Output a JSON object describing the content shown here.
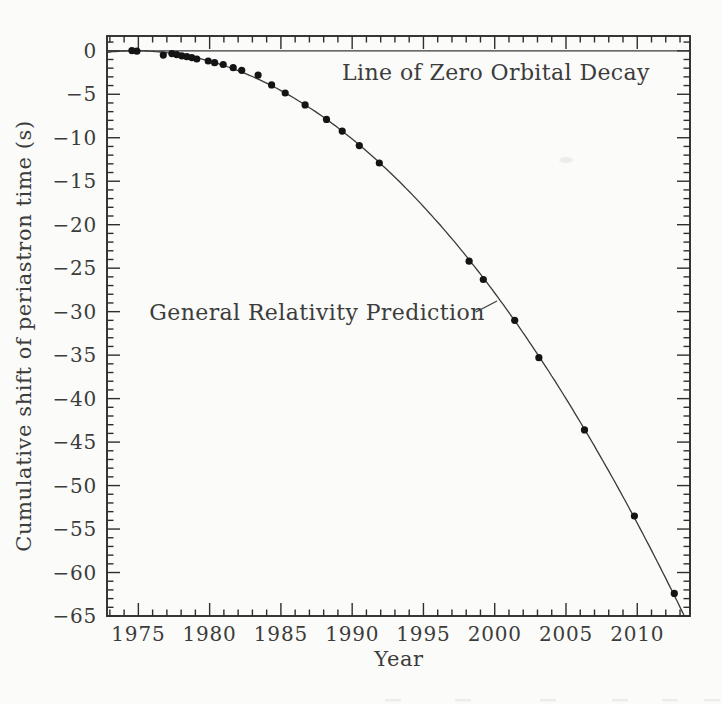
{
  "page": {
    "background": "#fbfbf9"
  },
  "chart_data": {
    "type": "scatter",
    "title": "",
    "xlabel": "Year",
    "ylabel": "Cumulative shift of periastron time (s)",
    "x_range": [
      1972.8,
      2013.7
    ],
    "y_range": [
      1.7,
      -65
    ],
    "grid": false,
    "legend": "none",
    "x_ticks": {
      "minor_step": 1,
      "major_values": [
        1975,
        1980,
        1985,
        1990,
        1995,
        2000,
        2005,
        2010
      ],
      "labels": [
        "1975",
        "1980",
        "1985",
        "1990",
        "1995",
        "2000",
        "2005",
        "2010"
      ]
    },
    "y_ticks": {
      "minor_step": 1,
      "major_values": [
        0,
        -5,
        -10,
        -15,
        -20,
        -25,
        -30,
        -35,
        -40,
        -45,
        -50,
        -55,
        -60,
        -65
      ],
      "labels": [
        "0",
        "−5",
        "−10",
        "−15",
        "−20",
        "−25",
        "−30",
        "−35",
        "−40",
        "−45",
        "−50",
        "−55",
        "−60",
        "−65"
      ]
    },
    "annotations": {
      "zero_line": "Line of Zero Orbital Decay",
      "gr_prediction": "General Relativity Prediction"
    },
    "zero_line_y": 0,
    "gr_curve": {
      "model": "shift = coefficient * (year - epoch)^2",
      "coefficient": -0.0438,
      "epoch": 1974.78
    },
    "series": [
      {
        "name": "Measured periastron shift",
        "points": [
          [
            1974.55,
            0.02
          ],
          [
            1974.9,
            -0.05
          ],
          [
            1976.75,
            -0.5
          ],
          [
            1977.35,
            -0.32
          ],
          [
            1977.7,
            -0.45
          ],
          [
            1978.05,
            -0.58
          ],
          [
            1978.4,
            -0.68
          ],
          [
            1978.75,
            -0.78
          ],
          [
            1979.1,
            -0.94
          ],
          [
            1979.9,
            -1.17
          ],
          [
            1980.35,
            -1.37
          ],
          [
            1980.95,
            -1.58
          ],
          [
            1981.65,
            -1.94
          ],
          [
            1982.25,
            -2.25
          ],
          [
            1983.4,
            -2.8
          ],
          [
            1984.35,
            -3.92
          ],
          [
            1985.3,
            -4.85
          ],
          [
            1986.7,
            -6.22
          ],
          [
            1988.2,
            -7.89
          ],
          [
            1989.3,
            -9.24
          ],
          [
            1990.5,
            -10.9
          ],
          [
            1991.9,
            -12.9
          ],
          [
            1998.2,
            -24.2
          ],
          [
            1999.2,
            -26.3
          ],
          [
            2001.4,
            -31.0
          ],
          [
            2003.1,
            -35.3
          ],
          [
            2006.3,
            -43.6
          ],
          [
            2009.8,
            -53.5
          ],
          [
            2012.6,
            -62.4
          ]
        ]
      }
    ],
    "colors": {
      "ink": "#2e2e2e",
      "dot": "#141414",
      "text": "#3c3c3c"
    }
  }
}
